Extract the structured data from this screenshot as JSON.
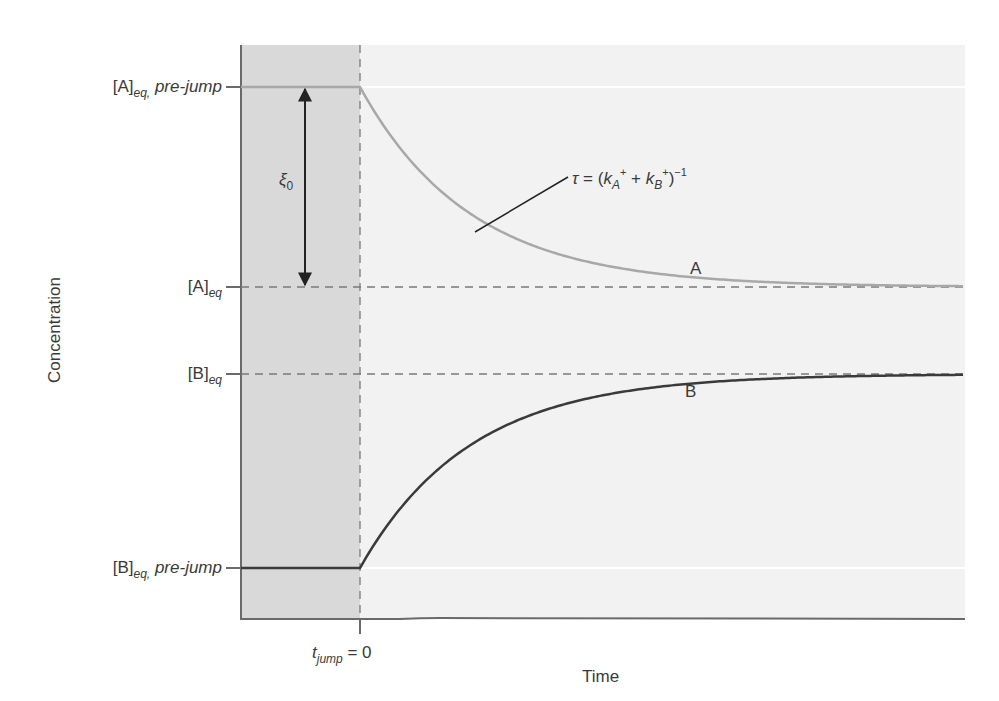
{
  "figure": {
    "y_axis_label": "Concentration",
    "x_axis_label": "Time",
    "x_tick": {
      "t": "t",
      "sub": "jump",
      "rest": " = 0"
    },
    "y_ticks": [
      {
        "id": "A_pre",
        "base": "[A]",
        "sub": "eq,",
        "suffix": " pre-jump"
      },
      {
        "id": "A_eq",
        "base": "[A]",
        "sub": "eq",
        "suffix": ""
      },
      {
        "id": "B_eq",
        "base": "[B]",
        "sub": "eq",
        "suffix": ""
      },
      {
        "id": "B_pre",
        "base": "[B]",
        "sub": "eq,",
        "suffix": " pre-jump"
      }
    ],
    "xi_label": {
      "symbol": "ξ",
      "sub": "0"
    },
    "tau_annotation": {
      "tau": "τ",
      "eq": " = (",
      "k": "k",
      "subA": "A",
      "plus_sup": "+",
      "mid": " + ",
      "subB": "B",
      "close": ")",
      "exp": "−1"
    },
    "curve_labels": {
      "A": "A",
      "B": "B"
    },
    "colors": {
      "pre_jump_region": "#d9d9d9",
      "post_jump_region": "#f2f2f2",
      "curve_A": "#a8a8a8",
      "curve_B": "#3a3a3a",
      "axis": "#6a6a6a",
      "dashed": "#7a7a7a"
    }
  },
  "chart_data": {
    "type": "line",
    "title": "",
    "xlabel": "Time",
    "ylabel": "Concentration",
    "annotations": [
      "τ = (k_A+ + k_B+)^-1",
      "ξ0",
      "t_jump = 0"
    ],
    "series": [
      {
        "name": "A",
        "description": "constant at [A]eq,pre-jump before t_jump, then exponential decay to [A]eq",
        "start_level": "[A]eq, pre-jump",
        "end_level": "[A]eq"
      },
      {
        "name": "B",
        "description": "constant at [B]eq,pre-jump before t_jump, then exponential rise to [B]eq",
        "start_level": "[B]eq, pre-jump",
        "end_level": "[B]eq"
      }
    ],
    "y_tick_labels": [
      "[A]eq, pre-jump",
      "[A]eq",
      "[B]eq",
      "[B]eq, pre-jump"
    ],
    "x_tick_labels": [
      "t_jump = 0"
    ],
    "grid": false
  }
}
